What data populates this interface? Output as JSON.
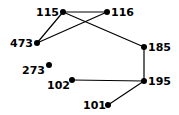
{
  "graph": {
    "nodes": [
      {
        "id": "115",
        "label": "115",
        "x": 63,
        "y": 12,
        "lx": 36,
        "ly": 16
      },
      {
        "id": "116",
        "label": "116",
        "x": 107,
        "y": 12,
        "lx": 111,
        "ly": 16
      },
      {
        "id": "473",
        "label": "473",
        "x": 37,
        "y": 43,
        "lx": 10,
        "ly": 47
      },
      {
        "id": "185",
        "label": "185",
        "x": 144,
        "y": 47,
        "lx": 148,
        "ly": 51
      },
      {
        "id": "273",
        "label": "273",
        "x": 49,
        "y": 65,
        "lx": 22,
        "ly": 74
      },
      {
        "id": "102",
        "label": "102",
        "x": 72,
        "y": 80,
        "lx": 47,
        "ly": 89
      },
      {
        "id": "195",
        "label": "195",
        "x": 144,
        "y": 81,
        "lx": 148,
        "ly": 85
      },
      {
        "id": "101",
        "label": "101",
        "x": 108,
        "y": 105,
        "lx": 83,
        "ly": 109
      }
    ],
    "edges": [
      [
        "115",
        "116"
      ],
      [
        "115",
        "473"
      ],
      [
        "116",
        "473"
      ],
      [
        "115",
        "185"
      ],
      [
        "185",
        "195"
      ],
      [
        "102",
        "195"
      ],
      [
        "195",
        "101"
      ]
    ]
  }
}
